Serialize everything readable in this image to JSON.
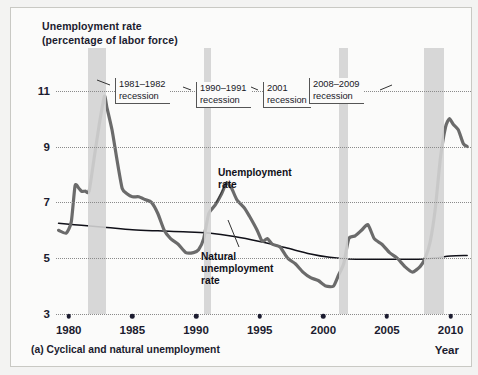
{
  "figure": {
    "axis_title": "Unemployment rate\n(percentage of labor force)",
    "caption": "(a) Cyclical and natural unemployment",
    "year_axis_label": "Year"
  },
  "annotations": {
    "unemployment_rate": "Unemployment\nrate",
    "natural_rate": "Natural\nunemployment\nrate"
  },
  "callouts": [
    {
      "id": "rec-1981",
      "text": "1981–1982\nrecession"
    },
    {
      "id": "rec-1990",
      "text": "1990–1991\nrecession"
    },
    {
      "id": "rec-2001",
      "text": "2001\nrecession"
    },
    {
      "id": "rec-2008",
      "text": "2008–2009\nrecession"
    }
  ],
  "chart_data": {
    "type": "line",
    "title": "Unemployment rate (percentage of labor force)",
    "xlabel": "Year",
    "ylabel": "Unemployment rate (percentage of labor force)",
    "xlim": [
      1979.0,
      2011.6
    ],
    "ylim": [
      3,
      11.6
    ],
    "yticks": [
      3,
      5,
      7,
      9,
      11
    ],
    "xticks": [
      1980,
      1985,
      1990,
      1995,
      2000,
      2005,
      2010
    ],
    "grid": "horizontal-dotted",
    "legend": "inline-annotations",
    "colors": {
      "unemployment_rate": "#6b6b6b",
      "natural_rate": "#101018",
      "recession_band": "#d3d3d3",
      "grid": "#8a8a8a",
      "text": "#1b1b2f",
      "panel_bg": "#fbfbfa"
    },
    "recession_bands": [
      {
        "label": "1981–1982 recession",
        "start": 1981.5,
        "end": 1982.9
      },
      {
        "label": "1990–1991 recession",
        "start": 1990.6,
        "end": 1991.2
      },
      {
        "label": "2001 recession",
        "start": 2001.2,
        "end": 2001.9
      },
      {
        "label": "2008–2009 recession",
        "start": 2007.9,
        "end": 2009.5
      }
    ],
    "series": [
      {
        "name": "Unemployment rate",
        "x": [
          1979.2,
          1979.8,
          1980.2,
          1980.5,
          1980.8,
          1981.0,
          1981.3,
          1981.6,
          1982.0,
          1982.4,
          1982.8,
          1983.0,
          1983.4,
          1983.8,
          1984.2,
          1984.6,
          1985.0,
          1985.5,
          1986.0,
          1986.5,
          1987.0,
          1987.5,
          1988.0,
          1988.6,
          1989.2,
          1989.8,
          1990.2,
          1990.6,
          1991.0,
          1991.5,
          1992.0,
          1992.4,
          1992.8,
          1993.2,
          1993.8,
          1994.2,
          1994.8,
          1995.2,
          1995.6,
          1996.0,
          1996.6,
          1997.2,
          1997.8,
          1998.4,
          1999.0,
          1999.6,
          2000.2,
          2000.8,
          2001.2,
          2001.6,
          2002.0,
          2002.5,
          2003.0,
          2003.5,
          2004.0,
          2004.6,
          2005.2,
          2005.8,
          2006.4,
          2007.0,
          2007.6,
          2008.0,
          2008.4,
          2008.8,
          2009.2,
          2009.6,
          2009.9,
          2010.2,
          2010.6,
          2011.0,
          2011.3
        ],
        "y": [
          6.0,
          5.9,
          6.3,
          7.6,
          7.5,
          7.4,
          7.4,
          7.4,
          8.6,
          9.8,
          10.8,
          10.4,
          9.6,
          8.5,
          7.5,
          7.3,
          7.2,
          7.2,
          7.1,
          7.0,
          6.6,
          6.0,
          5.7,
          5.5,
          5.2,
          5.2,
          5.3,
          5.7,
          6.6,
          6.9,
          7.3,
          7.7,
          7.5,
          7.1,
          6.8,
          6.5,
          6.0,
          5.6,
          5.7,
          5.5,
          5.4,
          5.0,
          4.8,
          4.5,
          4.3,
          4.2,
          4.0,
          4.0,
          4.4,
          4.8,
          5.7,
          5.8,
          6.0,
          6.2,
          5.7,
          5.5,
          5.2,
          5.0,
          4.7,
          4.5,
          4.7,
          5.0,
          5.6,
          6.8,
          8.6,
          9.7,
          10.0,
          9.8,
          9.6,
          9.1,
          9.0
        ]
      },
      {
        "name": "Natural unemployment rate",
        "x": [
          1979.2,
          1981.0,
          1983.0,
          1985.0,
          1987.0,
          1989.0,
          1991.0,
          1993.0,
          1995.0,
          1997.0,
          1999.0,
          2000.5,
          2002.0,
          2004.0,
          2006.0,
          2008.0,
          2009.0,
          2010.0,
          2011.3
        ],
        "y": [
          6.25,
          6.18,
          6.1,
          6.02,
          5.98,
          5.95,
          5.9,
          5.78,
          5.6,
          5.38,
          5.15,
          5.03,
          4.97,
          4.96,
          4.96,
          4.97,
          5.02,
          5.08,
          5.1
        ]
      }
    ]
  }
}
